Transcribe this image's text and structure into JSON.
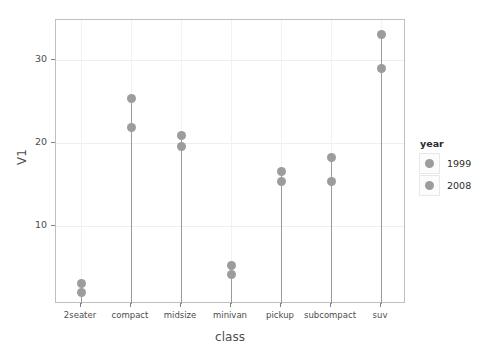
{
  "chart_data": {
    "type": "scatter",
    "title": "",
    "xlabel": "class",
    "ylabel": "V1",
    "categories": [
      "2seater",
      "compact",
      "midsize",
      "minivan",
      "pickup",
      "subcompact",
      "suv"
    ],
    "series": [
      {
        "name": "1999",
        "values": [
          3.1,
          25.3,
          20.9,
          5.2,
          16.6,
          18.3,
          33.1
        ]
      },
      {
        "name": "2008",
        "values": [
          2.0,
          21.9,
          19.6,
          4.1,
          15.4,
          15.3,
          28.9
        ]
      }
    ],
    "ylim": [
      0.6,
      34.8
    ],
    "yticks": [
      10,
      20,
      30
    ],
    "ytick_labels": [
      "10",
      "20",
      "30"
    ],
    "grid": true,
    "legend": {
      "title": "year",
      "position": "right",
      "entries": [
        "1999",
        "2008"
      ]
    },
    "marker_color": "#9c9c9c",
    "stem_color": "#9a9a9a",
    "panel_border_color": "#bfbfbf",
    "grid_color": "#efefef"
  }
}
